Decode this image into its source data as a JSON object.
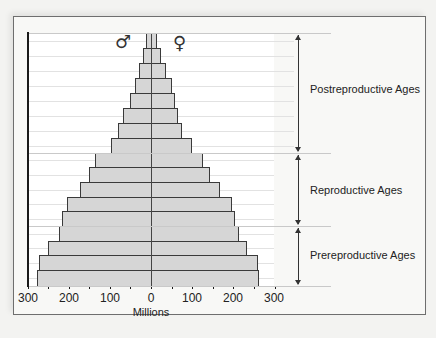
{
  "chart_data": {
    "type": "bar",
    "subtype": "population-pyramid",
    "title": "",
    "xlabel": "Millions",
    "ylabel": "",
    "xlim": [
      -300,
      300
    ],
    "x_ticks": [
      "300",
      "200",
      "100",
      "0",
      "100",
      "200",
      "300"
    ],
    "grid": true,
    "legend": {
      "male_symbol": "♂",
      "female_symbol": "♀",
      "position": "top-center"
    },
    "categories_top_to_bottom": [
      "cohort-1",
      "cohort-2",
      "cohort-3",
      "cohort-4",
      "cohort-5",
      "cohort-6",
      "cohort-7",
      "cohort-8",
      "cohort-9",
      "cohort-10",
      "cohort-11",
      "cohort-12",
      "cohort-13",
      "cohort-14",
      "cohort-15",
      "cohort-16",
      "cohort-17"
    ],
    "series": [
      {
        "name": "Male",
        "side": "left",
        "values": [
          12,
          20,
          30,
          40,
          52,
          67,
          80,
          98,
          135,
          150,
          172,
          204,
          216,
          223,
          250,
          272,
          277
        ]
      },
      {
        "name": "Female",
        "side": "right",
        "values": [
          14,
          25,
          36,
          50,
          58,
          66,
          76,
          99,
          126,
          143,
          167,
          197,
          205,
          213,
          233,
          260,
          262
        ]
      }
    ],
    "age_groups": [
      {
        "label": "Postreproductive Ages",
        "cohorts_top_to_bottom": [
          1,
          8
        ]
      },
      {
        "label": "Reproductive Ages",
        "cohorts_top_to_bottom": [
          9,
          13
        ]
      },
      {
        "label": "Prereproductive Ages",
        "cohorts_top_to_bottom": [
          14,
          17
        ]
      }
    ]
  },
  "labels": {
    "male": "♂",
    "female": "♀",
    "xlabel": "Millions",
    "ticks": [
      "300",
      "200",
      "100",
      "0",
      "100",
      "200",
      "300"
    ],
    "groups": [
      "Postreproductive Ages",
      "Reproductive Ages",
      "Prereproductive Ages"
    ]
  },
  "colors": {
    "bar_fill": "#d6d6d6",
    "bar_border": "#3a3a3a",
    "axis": "#1a1a1a"
  }
}
